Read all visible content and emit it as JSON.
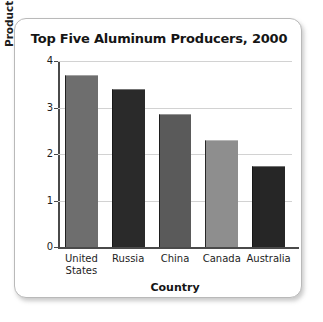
{
  "chart_data": {
    "type": "bar",
    "title": "Top Five Aluminum Producers, 2000",
    "xlabel": "Country",
    "ylabel_bold": "Production",
    "ylabel_rest": " (in thousand metric tons)",
    "ylabel_full": "Production (in thousand metric tons)",
    "categories": [
      "United States",
      "Russia",
      "China",
      "Canada",
      "Australia"
    ],
    "category_lines": [
      [
        "United",
        "States"
      ],
      [
        "Russia"
      ],
      [
        "China"
      ],
      [
        "Canada"
      ],
      [
        "Australia"
      ]
    ],
    "values": [
      3.7,
      3.4,
      2.85,
      2.3,
      1.75
    ],
    "ylim": [
      0,
      4
    ],
    "yticks": [
      0,
      1,
      2,
      3,
      4
    ],
    "ytick_labels": [
      "0",
      "1",
      "2",
      "3",
      "4"
    ],
    "grid": true,
    "legend": false,
    "bar_colors": [
      "#6e6e6e",
      "#2a2a2a",
      "#5a5a5a",
      "#8e8e8e",
      "#262626"
    ],
    "axis_color": "#4a4a4a",
    "gridline_color": "#d2d2d2",
    "card_border_color": "#b9b9b9",
    "background": "#ffffff"
  }
}
